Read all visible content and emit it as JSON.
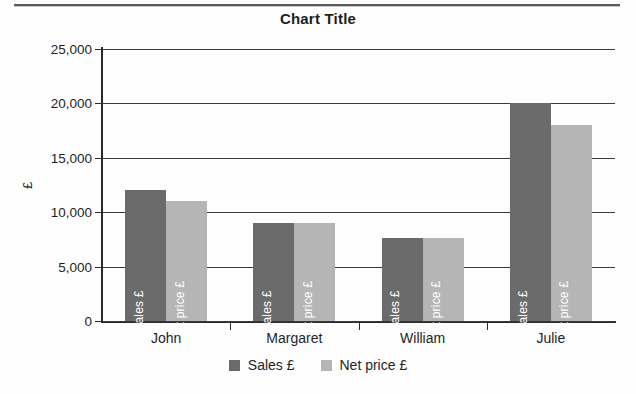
{
  "chart_data": {
    "type": "bar",
    "title": "Chart Title",
    "xlabel": "",
    "ylabel": "£",
    "ylim": [
      0,
      25000
    ],
    "yticks": [
      0,
      5000,
      10000,
      15000,
      20000,
      25000
    ],
    "ytick_labels": [
      "0",
      "5,000",
      "10,000",
      "15,000",
      "20,000",
      "25,000"
    ],
    "grid": true,
    "legend_position": "bottom",
    "categories": [
      "John",
      "Margaret",
      "William",
      "Julie"
    ],
    "series": [
      {
        "name": "Sales £",
        "color": "#6b6b6b",
        "values": [
          12000,
          9000,
          7600,
          20000
        ]
      },
      {
        "name": "Net price £",
        "color": "#b5b5b5",
        "values": [
          11000,
          9000,
          7600,
          18000
        ]
      }
    ],
    "bar_inline_labels": [
      [
        "Sales £",
        "Net price £"
      ],
      [
        "Sales £",
        "Net price £"
      ],
      [
        "Sales £",
        "Net price £"
      ],
      [
        "Sales £",
        "Net price £"
      ]
    ]
  },
  "legend": {
    "items": [
      {
        "label": "Sales £",
        "color": "#6b6b6b"
      },
      {
        "label": "Net price £",
        "color": "#b5b5b5"
      }
    ]
  },
  "colors": {
    "series_dark": "#6b6b6b",
    "series_light": "#b5b5b5",
    "axis": "#2a2a2a",
    "grid": "#3a3a3a",
    "text": "#1f1f1f",
    "background": "#ffffff"
  }
}
